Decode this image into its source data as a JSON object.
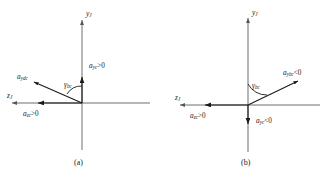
{
  "figure": {
    "background_color": "#ffffff",
    "axis_color": "#6e6e6e",
    "vector_color": "#1a1a1a"
  },
  "panels": [
    {
      "id": "a",
      "caption": "(a)",
      "origin": {
        "x": 82,
        "y": 103
      },
      "axes": {
        "vertical": {
          "label_base": "y",
          "label_sub": "J",
          "direction": "up",
          "arrow": "up"
        },
        "horizontal": {
          "label_base": "z",
          "label_sub": "J",
          "direction": "left",
          "arrow": "left"
        }
      },
      "vectors": [
        {
          "name": "a-yc-vertical",
          "label_base": "a",
          "label_sub": "yc",
          "relation": ">0",
          "direction": "up",
          "tip": {
            "x": 82,
            "y": 74
          }
        },
        {
          "name": "a-zc-horizontal",
          "label_base": "a",
          "label_sub": "zc",
          "relation": ">0",
          "direction": "left",
          "tip": {
            "x": 33,
            "y": 103
          }
        },
        {
          "name": "a-ydc-resultant",
          "label_base": "a",
          "label_sub": "ydc",
          "relation": "",
          "direction": "upper-left",
          "tip": {
            "x": 28,
            "y": 83
          }
        }
      ],
      "angle": {
        "name": "gamma-bc",
        "label_base": "γ",
        "label_sub": "bc",
        "relation": ""
      }
    },
    {
      "id": "b",
      "caption": "(b)",
      "origin": {
        "x": 248,
        "y": 105
      },
      "axes": {
        "vertical": {
          "label_base": "y",
          "label_sub": "J",
          "direction": "up",
          "arrow": "up"
        },
        "horizontal": {
          "label_base": "z",
          "label_sub": "J",
          "direction": "left",
          "arrow": "left"
        }
      },
      "vectors": [
        {
          "name": "a-yc-vertical",
          "label_base": "a",
          "label_sub": "yc",
          "relation": "<0",
          "direction": "down",
          "tip": {
            "x": 248,
            "y": 128
          }
        },
        {
          "name": "a-zc-horizontal",
          "label_base": "a",
          "label_sub": "zc",
          "relation": ">0",
          "direction": "left",
          "tip": {
            "x": 200,
            "y": 105
          }
        },
        {
          "name": "a-ybc-resultant",
          "label_base": "a",
          "label_sub": "ybc",
          "relation": "<0",
          "direction": "upper-right",
          "tip": {
            "x": 302,
            "y": 80
          }
        }
      ],
      "angle": {
        "name": "gamma-bc",
        "label_base": "γ",
        "label_sub": "bc",
        "relation": ""
      }
    }
  ]
}
